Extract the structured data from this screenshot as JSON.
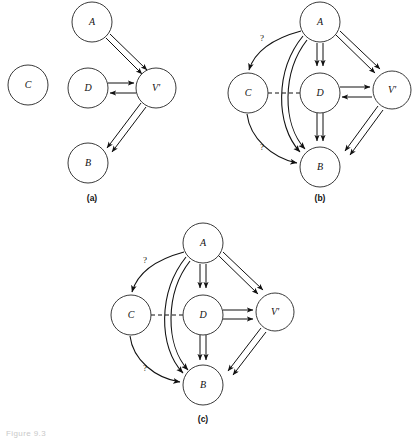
{
  "figure": {
    "caption": "Figure 9.3",
    "panels": [
      {
        "id": "a",
        "label": "(a)",
        "nodes": [
          {
            "id": "C",
            "label": "C",
            "cx": 28,
            "cy": 85,
            "r": 20
          },
          {
            "id": "A",
            "label": "A",
            "cx": 92,
            "cy": 22,
            "r": 20
          },
          {
            "id": "D",
            "label": "D",
            "cx": 88,
            "cy": 88,
            "r": 20
          },
          {
            "id": "V",
            "label": "V'",
            "cx": 156,
            "cy": 88,
            "r": 20
          },
          {
            "id": "B",
            "label": "B",
            "cx": 88,
            "cy": 163,
            "r": 20
          }
        ],
        "edges": [
          {
            "from": "A",
            "to": "V",
            "kind": "double-straight",
            "direction": "forward"
          },
          {
            "from": "D",
            "to": "V",
            "kind": "straight",
            "direction": "forward"
          },
          {
            "from": "V",
            "to": "D",
            "kind": "straight",
            "direction": "forward"
          },
          {
            "from": "V",
            "to": "B",
            "kind": "double-straight",
            "direction": "forward"
          }
        ]
      },
      {
        "id": "b",
        "label": "(b)",
        "nodes": [
          {
            "id": "A",
            "label": "A",
            "cx": 320,
            "cy": 22,
            "r": 20
          },
          {
            "id": "C",
            "label": "C",
            "cx": 248,
            "cy": 93,
            "r": 20
          },
          {
            "id": "D",
            "label": "D",
            "cx": 320,
            "cy": 93,
            "r": 20
          },
          {
            "id": "V",
            "label": "V'",
            "cx": 392,
            "cy": 90,
            "r": 19
          },
          {
            "id": "B",
            "label": "B",
            "cx": 320,
            "cy": 167,
            "r": 20
          }
        ],
        "edges": [
          {
            "from": "A",
            "to": "C",
            "kind": "curve",
            "direction": "forward",
            "annotation": "?"
          },
          {
            "from": "C",
            "to": "B",
            "kind": "curve",
            "direction": "forward",
            "annotation": "?"
          },
          {
            "from": "C",
            "to": "D",
            "kind": "dashed",
            "direction": "none"
          },
          {
            "from": "A",
            "to": "D",
            "kind": "double-straight",
            "direction": "forward"
          },
          {
            "from": "A",
            "to": "B",
            "kind": "double-curve",
            "direction": "forward"
          },
          {
            "from": "A",
            "to": "V",
            "kind": "double-straight",
            "direction": "forward"
          },
          {
            "from": "D",
            "to": "V",
            "kind": "straight",
            "direction": "forward"
          },
          {
            "from": "V",
            "to": "D",
            "kind": "straight",
            "direction": "forward"
          },
          {
            "from": "D",
            "to": "B",
            "kind": "double-straight",
            "direction": "forward"
          },
          {
            "from": "V",
            "to": "B",
            "kind": "double-straight",
            "direction": "forward"
          }
        ],
        "annotations": [
          {
            "text": "?",
            "x": 262,
            "y": 40
          },
          {
            "text": "?",
            "x": 262,
            "y": 148
          }
        ]
      },
      {
        "id": "c",
        "label": "(c)",
        "nodes": [
          {
            "id": "A",
            "label": "A",
            "cx": 203,
            "cy": 243,
            "r": 20
          },
          {
            "id": "C",
            "label": "C",
            "cx": 131,
            "cy": 315,
            "r": 20
          },
          {
            "id": "D",
            "label": "D",
            "cx": 203,
            "cy": 315,
            "r": 20
          },
          {
            "id": "V",
            "label": "V'",
            "cx": 275,
            "cy": 312,
            "r": 19
          },
          {
            "id": "B",
            "label": "B",
            "cx": 203,
            "cy": 385,
            "r": 20
          }
        ],
        "edges": [
          {
            "from": "A",
            "to": "C",
            "kind": "curve",
            "direction": "forward",
            "annotation": "?"
          },
          {
            "from": "C",
            "to": "B",
            "kind": "curve",
            "direction": "forward",
            "annotation": "?"
          },
          {
            "from": "C",
            "to": "D",
            "kind": "dashed",
            "direction": "none"
          },
          {
            "from": "A",
            "to": "D",
            "kind": "double-straight",
            "direction": "forward"
          },
          {
            "from": "A",
            "to": "B",
            "kind": "double-curve",
            "direction": "forward"
          },
          {
            "from": "A",
            "to": "V",
            "kind": "double-straight",
            "direction": "forward"
          },
          {
            "from": "D",
            "to": "V",
            "kind": "double-straight",
            "direction": "forward"
          },
          {
            "from": "D",
            "to": "B",
            "kind": "double-straight",
            "direction": "forward"
          },
          {
            "from": "V",
            "to": "B",
            "kind": "double-straight",
            "direction": "forward"
          }
        ],
        "annotations": [
          {
            "text": "?",
            "x": 145,
            "y": 262
          },
          {
            "text": "?",
            "x": 145,
            "y": 370
          }
        ]
      }
    ],
    "panel_label_positions": [
      {
        "id": "a",
        "x": 92,
        "y": 201
      },
      {
        "id": "b",
        "x": 320,
        "y": 201
      },
      {
        "id": "c",
        "x": 203,
        "y": 422
      }
    ],
    "colors": {
      "stroke": "#111111",
      "node_stroke": "#3a3a3a",
      "background": "#ffffff",
      "caption": "#c9c9c9"
    }
  }
}
